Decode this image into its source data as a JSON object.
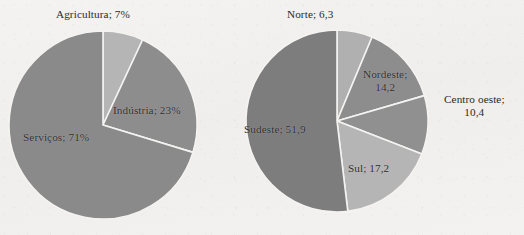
{
  "figure": {
    "background_color": "#f2f1ef",
    "text_color": "#2b2b2b",
    "slice_border_color": "#f4f3f1"
  },
  "charts": [
    {
      "id": "setores-economia",
      "type": "pie",
      "center": {
        "x": 103,
        "y": 125
      },
      "radius": 94,
      "start_angle_deg": -90,
      "labels": {
        "agricultura": "Agricultura; 7%",
        "industria": "Indústria; 23%",
        "servicos": "Serviços; 71%"
      }
    },
    {
      "id": "regioes-brasil",
      "type": "pie",
      "center": {
        "x": 337,
        "y": 121
      },
      "radius": 91,
      "start_angle_deg": -90,
      "labels": {
        "norte": "Norte; 6,3",
        "nordeste_line1": "Nordeste;",
        "nordeste_line2": "14,2",
        "centro_oeste_line1": "Centro oeste;",
        "centro_oeste_line2": "10,4",
        "sul": "Sul; 17,2",
        "sudeste": "Sudeste; 51,9"
      }
    }
  ],
  "chart_data": [
    {
      "type": "pie",
      "title": "",
      "categories": [
        "Agricultura",
        "Indústria",
        "Serviços"
      ],
      "values": [
        7,
        23,
        71
      ],
      "value_suffix": "%",
      "data_labels": [
        "Agricultura; 7%",
        "Indústria; 23%",
        "Serviços; 71%"
      ],
      "colors": [
        "#b5b5b5",
        "#8d8d8d",
        "#8a8a8a"
      ],
      "legend": "none",
      "grid": false,
      "start_angle_deg": -90,
      "direction": "clockwise"
    },
    {
      "type": "pie",
      "title": "",
      "categories": [
        "Norte",
        "Nordeste",
        "Centro oeste",
        "Sul",
        "Sudeste"
      ],
      "values": [
        6.3,
        14.2,
        10.4,
        17.2,
        51.9
      ],
      "value_suffix": "",
      "data_labels": [
        "Norte; 6,3",
        "Nordeste; 14,2",
        "Centro oeste; 10,4",
        "Sul; 17,2",
        "Sudeste; 51,9"
      ],
      "colors": [
        "#b0b0b0",
        "#8d8d8d",
        "#909090",
        "#b5b5b5",
        "#7d7d7d"
      ],
      "legend": "none",
      "grid": false,
      "start_angle_deg": -90,
      "direction": "clockwise"
    }
  ]
}
